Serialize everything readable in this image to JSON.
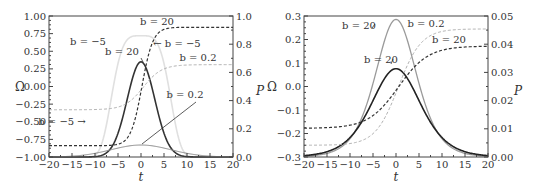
{
  "chart_data": [
    {
      "type": "line",
      "panel": "left",
      "title": "",
      "xlabel": "t",
      "ylabel": "Ω",
      "ylabel_right": "P",
      "xlim": [
        -20,
        20
      ],
      "ylim": [
        -1.0,
        1.0
      ],
      "ylim_right": [
        0.0,
        1.0
      ],
      "xticks": [
        "−20",
        "−15",
        "−10",
        "−5",
        "0",
        "5",
        "10",
        "15",
        "20"
      ],
      "yticks": [
        "1.00",
        "0.75",
        "0.50",
        "0.25",
        "0.00",
        "−0.25",
        "−0.50",
        "−0.75",
        "−1.00"
      ],
      "yticks_right": [
        "1.0",
        "0.8",
        "0.6",
        "0.4",
        "0.2",
        "0.0"
      ],
      "grid": false,
      "series": [
        {
          "name": "P, b = −5",
          "axis": "right",
          "style": "solid",
          "color": "#e0e0e0",
          "width": 1.6,
          "shape": "flatpeak",
          "peak": 0.86,
          "sigma": 7.0,
          "power": 4
        },
        {
          "name": "P, b = 20",
          "axis": "right",
          "style": "solid",
          "color": "#333333",
          "width": 1.6,
          "shape": "gauss",
          "peak": 0.675,
          "sigma": 3.0
        },
        {
          "name": "P, b = 0.2",
          "axis": "right",
          "style": "solid",
          "color": "#8a8a8a",
          "width": 1.0,
          "shape": "gauss",
          "peak": 0.085,
          "sigma": 6.5
        },
        {
          "name": "Ω, b = 20 / b = −5",
          "axis": "left",
          "style": "dashed",
          "color": "#333333",
          "width": 1.2,
          "shape": "tanh",
          "low": -0.84,
          "high": 0.84,
          "center": 0.2,
          "scale": 2.4
        },
        {
          "name": "Ω, b = 0.2",
          "axis": "left",
          "style": "dashed",
          "color": "#b0b0b0",
          "width": 1.0,
          "shape": "tanh",
          "low": -0.33,
          "high": 0.31,
          "center": 0.5,
          "scale": 4.0
        }
      ],
      "annotations": [
        {
          "text": "b = −5",
          "x": 88,
          "y": 45
        },
        {
          "text": "b = 20",
          "x": 157,
          "y": 25
        },
        {
          "text": "b = 20",
          "x": 122,
          "y": 55
        },
        {
          "text": "← b = −5",
          "x": 177,
          "y": 47
        },
        {
          "text": "b = 0.2",
          "x": 198,
          "y": 61
        },
        {
          "text": "b = −5 →",
          "x": 62,
          "y": 125
        },
        {
          "text": "b = 0.2",
          "x": 185,
          "y": 98
        }
      ]
    },
    {
      "type": "line",
      "panel": "right",
      "title": "",
      "xlabel": "t",
      "ylabel": "Ω",
      "ylabel_right": "P",
      "xlim": [
        -20,
        20
      ],
      "ylim": [
        -0.3,
        0.3
      ],
      "ylim_right": [
        0.0,
        0.05
      ],
      "xticks": [
        "−20",
        "−15",
        "−10",
        "−5",
        "0",
        "5",
        "10",
        "15",
        "20"
      ],
      "yticks": [
        "0.3",
        "0.2",
        "0.1",
        "0.0",
        "−0.1",
        "−0.2",
        "−0.3"
      ],
      "yticks_right": [
        "0.05",
        "0.04",
        "0.03",
        "0.02",
        "0.01",
        "0.00"
      ],
      "grid": false,
      "series": [
        {
          "name": "P, b = 20 (gray)",
          "axis": "right",
          "style": "solid",
          "color": "#9a9a9a",
          "width": 1.3,
          "shape": "sech",
          "peak": 0.0488,
          "sigma": 6.0
        },
        {
          "name": "P, b = 20 (black)",
          "axis": "right",
          "style": "solid",
          "color": "#222222",
          "width": 1.6,
          "shape": "sech",
          "peak": 0.0313,
          "sigma": 7.2
        },
        {
          "name": "Ω, b = 0.2",
          "axis": "left",
          "style": "dashed",
          "color": "#b0b0b0",
          "width": 1.0,
          "shape": "tanh",
          "low": -0.25,
          "high": 0.245,
          "center": 0.5,
          "scale": 5.0
        },
        {
          "name": "Ω, b = 20",
          "axis": "left",
          "style": "dashed",
          "color": "#333333",
          "width": 1.2,
          "shape": "tanh",
          "low": -0.178,
          "high": 0.172,
          "center": 0.5,
          "scale": 6.5
        }
      ],
      "annotations": [
        {
          "text": "b = 20",
          "x": 359,
          "y": 29
        },
        {
          "text": "b = 0.2",
          "x": 426,
          "y": 27
        },
        {
          "text": "b = 20",
          "x": 449,
          "y": 43
        },
        {
          "text": "b = 20",
          "x": 381,
          "y": 63
        }
      ]
    }
  ]
}
